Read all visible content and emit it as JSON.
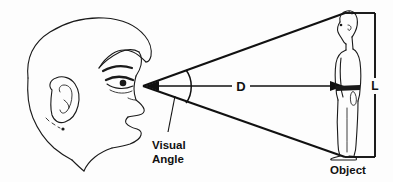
{
  "diagram": {
    "type": "line-drawing-schematic",
    "background_color": "#fdfdfd",
    "ink_color": "#111111",
    "labels": {
      "visual_angle_line1": "Visual",
      "visual_angle_line2": "Angle",
      "distance": "D",
      "length": "L",
      "object": "Object"
    },
    "elements": {
      "observer": "head-profile-facing-right",
      "observer_eye_point": "apex-of-visual-angle",
      "target": "standing-person-figure-profile",
      "sight_lines": "two-rays-from-eye-to-object-top-and-bottom",
      "angle_arc": "arc-between-sight-lines",
      "distance_arrow": "double-headed-horizontal-arrow",
      "height_bracket": "vertical-dimension-bracket"
    },
    "geometry": {
      "eye_x": 143,
      "eye_y": 86,
      "object_top_x": 345,
      "object_top_y": 13,
      "object_bottom_x": 345,
      "object_bottom_y": 157,
      "bracket_x": 375,
      "arc_radius": 46,
      "distance_arrow_y": 86,
      "distance_arrow_x1": 150,
      "distance_arrow_x2": 340
    }
  }
}
